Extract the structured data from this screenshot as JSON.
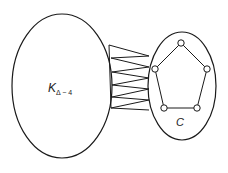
{
  "diagram": {
    "type": "graph-construction",
    "left_set": {
      "label_main": "K",
      "label_sub": "Δ − 4",
      "shape": "ellipse"
    },
    "right_set": {
      "label": "C",
      "shape": "ellipse",
      "contains": "5-cycle (pentagon)",
      "vertices": 5
    },
    "connections": "complete bipartite-style zigzag edges between the two sets",
    "colors": {
      "stroke": "#1a1a1a",
      "background": "#ffffff",
      "vertex_fill": "#ffffff"
    }
  }
}
